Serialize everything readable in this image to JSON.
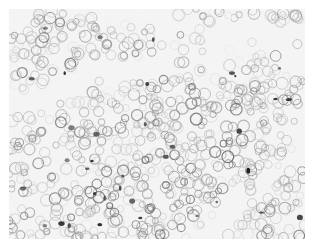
{
  "image": {
    "kind": "grayscale microscopy (histology) image",
    "description": "Dense field of rounded cells with dark-stained membranes; pale diagonal stromal bands run across the center",
    "colors": {
      "background": "#ffffff",
      "tissue": "#f4f4f4",
      "membrane": "#8a8a8a",
      "dark_stain": "#2a2a2a"
    }
  }
}
